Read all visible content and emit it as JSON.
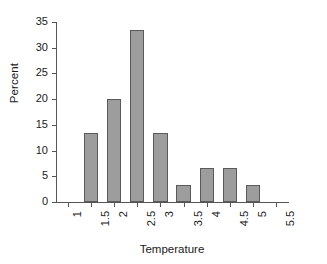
{
  "chart_data": {
    "type": "bar",
    "title": "",
    "xlabel": "Temperature",
    "ylabel": "Percent",
    "grid": false,
    "legend": false,
    "bar_color": "#9d9d9d",
    "bar_border_color": "#5a5a5a",
    "axis_color": "#555555",
    "xlim": [
      0.75,
      5.75
    ],
    "ylim": [
      0,
      35
    ],
    "yticks": [
      0,
      5,
      10,
      15,
      20,
      25,
      30,
      35
    ],
    "ytick_labels": [
      "0",
      "5",
      "10",
      "15",
      "20",
      "25",
      "30",
      "35"
    ],
    "xticks": [
      1,
      1.5,
      2,
      2.5,
      3,
      3.5,
      4,
      4.5,
      5,
      5.5
    ],
    "xtick_labels": [
      "1",
      "1.5",
      "2",
      "2.5",
      "3",
      "3.5",
      "4",
      "4.5",
      "5",
      "5.5"
    ],
    "xtick_rotation": 90,
    "categories": [
      1,
      1.5,
      2,
      2.5,
      3,
      3.5,
      4,
      4.5,
      5,
      5.5
    ],
    "values": [
      0,
      13.4,
      20.1,
      33.4,
      13.4,
      3.4,
      6.7,
      6.7,
      3.4,
      0
    ],
    "bars": [
      {
        "x": 1.5,
        "label": "1.5",
        "value": 13.4
      },
      {
        "x": 2,
        "label": "2",
        "value": 20.1
      },
      {
        "x": 2.5,
        "label": "2.5",
        "value": 33.4
      },
      {
        "x": 3,
        "label": "3",
        "value": 13.4
      },
      {
        "x": 3.5,
        "label": "3.5",
        "value": 3.4
      },
      {
        "x": 4,
        "label": "4",
        "value": 6.7
      },
      {
        "x": 4.5,
        "label": "4.5",
        "value": 6.7
      },
      {
        "x": 5,
        "label": "5",
        "value": 3.4
      }
    ]
  }
}
